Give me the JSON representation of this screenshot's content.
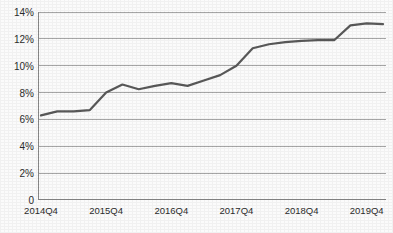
{
  "chart_data": {
    "type": "line",
    "title": "",
    "xlabel": "",
    "ylabel": "",
    "ylim": [
      0,
      14
    ],
    "grid": true,
    "legend": "none",
    "y_ticks": [
      0,
      2,
      4,
      6,
      8,
      10,
      12,
      14
    ],
    "y_tick_labels": [
      "0",
      "2%",
      "4%",
      "6%",
      "8%",
      "10%",
      "12%",
      "14%"
    ],
    "x_tick_labels": [
      "2014Q4",
      "2015Q4",
      "2016Q4",
      "2017Q4",
      "2018Q4",
      "2019Q4"
    ],
    "x_label_indices": [
      0,
      4,
      8,
      12,
      16,
      20
    ],
    "line_color": "#595959",
    "grid_color": "#a6a6a6",
    "axis_color": "#868686",
    "background_color": "#fbfbfb",
    "x": [
      "2014Q4",
      "2015Q1",
      "2015Q2",
      "2015Q3",
      "2015Q4",
      "2016Q1",
      "2016Q2",
      "2016Q3",
      "2016Q4",
      "2017Q1",
      "2017Q2",
      "2017Q3",
      "2017Q4",
      "2018Q1",
      "2018Q2",
      "2018Q3",
      "2018Q4",
      "2019Q1",
      "2019Q2",
      "2019Q3",
      "2019Q4",
      "2020Q1"
    ],
    "series": [
      {
        "name": "Share",
        "values": [
          6.3,
          6.6,
          6.6,
          6.7,
          8.0,
          8.6,
          8.25,
          8.5,
          8.7,
          8.5,
          8.9,
          9.3,
          10.0,
          11.3,
          11.6,
          11.75,
          11.85,
          11.9,
          11.9,
          13.0,
          13.15,
          13.1
        ]
      }
    ]
  }
}
